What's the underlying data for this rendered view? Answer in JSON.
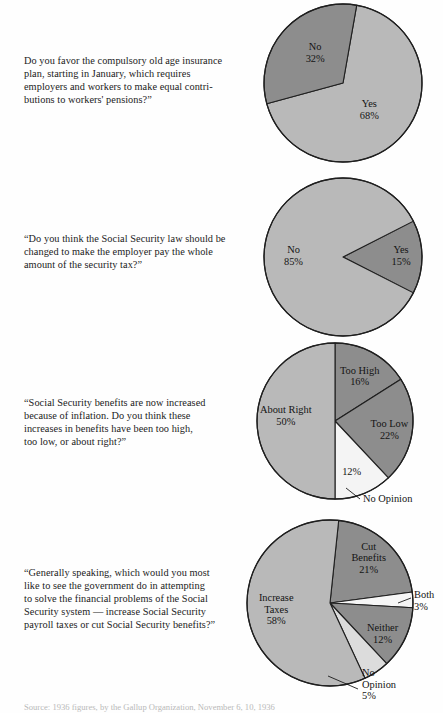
{
  "document": {
    "title": "Social Security Opinion Polls",
    "source_note": "Source: 1936 figures, by the Gallup Organization, November 6, 10, 1936"
  },
  "colors": {
    "page_background": "#fefefe",
    "slice_light": "#b9b9b9",
    "slice_dark": "#8d8d8d",
    "slice_pale": "#efefef",
    "slice_white": "#f7f7f7",
    "outline": "#1f1f1f",
    "text": "#1a1a1a"
  },
  "chart_data": [
    {
      "type": "pie",
      "id": "compulsory-old-age-insurance",
      "title": "Do you favor the compulsory old age insurance plan, starting in January, which requires employers and workers to make equal contributions to workers' pensions?”",
      "start_angle": 10,
      "categories": [
        "Yes",
        "No"
      ],
      "values": [
        68,
        32
      ],
      "labels": [
        "Yes\n68%",
        "No\n32%"
      ],
      "slice_colors": [
        "#b9b9b9",
        "#8d8d8d"
      ],
      "label_mode": [
        "inside",
        "inside"
      ],
      "label_radius": [
        0.52,
        0.58
      ],
      "legend": "none",
      "grid": false
    },
    {
      "type": "pie",
      "id": "employer-pay-whole-security-tax",
      "title": "“Do you think the Social Security law should be changed to make the employer pay the whole amount of the security tax?”",
      "start_angle": 63,
      "categories": [
        "Yes",
        "No"
      ],
      "values": [
        15,
        85
      ],
      "labels": [
        "Yes\n15%",
        "No\n85%"
      ],
      "slice_colors": [
        "#8d8d8d",
        "#b9b9b9"
      ],
      "label_mode": [
        "inside",
        "inside"
      ],
      "label_radius": [
        0.66,
        0.55
      ],
      "legend": "none",
      "grid": false
    },
    {
      "type": "pie",
      "id": "benefit-increases-too-high-low",
      "title": "“Social Security benefits are now increased because of inflation.  Do you think these increases in benefits have been too high, too low, or about right?”",
      "start_angle": 0,
      "categories": [
        "Too High",
        "Too Low",
        "No Opinion",
        "About Right"
      ],
      "values": [
        16,
        22,
        12,
        50
      ],
      "labels": [
        "Too High\n16%",
        "Too Low\n22%",
        "12%",
        "About Right\n50%"
      ],
      "slice_colors": [
        "#8d8d8d",
        "#8d8d8d",
        "#f4f4f4",
        "#b9b9b9"
      ],
      "label_mode": [
        "inside",
        "inside",
        "inside",
        "inside"
      ],
      "label_radius": [
        0.55,
        0.6,
        0.58,
        0.58
      ],
      "callouts": [
        {
          "text": "No Opinion",
          "slice": 2,
          "anchor": "start"
        }
      ],
      "legend": "none",
      "grid": false
    },
    {
      "type": "pie",
      "id": "increase-taxes-or-cut-benefits",
      "title": "“Generally speaking, which would you most like to see the government do in attempting to solve the financial problems of the Social Security system — increase Social Security payroll taxes or cut Social Security benefits?”",
      "start_angle": 6,
      "categories": [
        "Cut Benefits",
        "Both",
        "Neither",
        "No Opinion",
        "Increase Taxes"
      ],
      "values": [
        21,
        3,
        12,
        5,
        58
      ],
      "labels": [
        "Cut\nBenefits\n21%",
        "Both\n3%",
        "Neither\n12%",
        "No\nOpinion\n5%",
        "Increase\nTaxes\n58%"
      ],
      "slice_colors": [
        "#8d8d8d",
        "#f6f6f6",
        "#8d8d8d",
        "#dcdcdc",
        "#b9b9b9"
      ],
      "label_mode": [
        "inside",
        "outside",
        "inside",
        "outside",
        "inside"
      ],
      "label_radius": [
        0.6,
        0.6,
        0.62,
        0.6,
        0.56
      ],
      "callouts": [
        {
          "text": "Both\n3%",
          "slice": 1,
          "anchor": "start"
        },
        {
          "text": "No\nOpinion\n5%",
          "slice": 3,
          "anchor": "start"
        }
      ],
      "legend": "none",
      "grid": false
    }
  ],
  "panels": [
    {
      "question": "Do you favor the compulsory old age insurance plan, starting in January, which requires employers and workers to make equal contributions to workers' pensions?”",
      "question_lines": [
        "Do you favor the compulsory old age insurance",
        "plan, starting in January, which requires",
        "employers and workers to make equal contri-",
        "butions to workers' pensions?”"
      ]
    },
    {
      "question": "“Do you think the Social Security law should be changed to make the employer pay the whole amount of the security tax?”",
      "question_lines": [
        "“Do you think the Social Security law should be",
        "changed to make the employer pay the whole",
        "amount of the security tax?”"
      ]
    },
    {
      "question": "“Social Security benefits are now increased because of inflation.  Do you think these increases in benefits have been too high, too low, or about right?”",
      "question_lines": [
        "“Social Security benefits are now increased",
        "because of inflation.  Do you think these",
        "increases in benefits have been too high,",
        "too low, or about right?”"
      ]
    },
    {
      "question": "“Generally speaking, which would you most like to see the government do in attempting to solve the financial problems of the Social Security system — increase Social Security payroll taxes or cut Social Security benefits?”",
      "question_lines": [
        "“Generally speaking, which would you most",
        "like to see the government do in attempting",
        "to solve the financial problems of the Social",
        "Security system — increase Social Security",
        "payroll taxes or cut Social Security benefits?”"
      ]
    }
  ],
  "pie_labels": {
    "chart1": [
      {
        "name": "Yes",
        "pct": "68%"
      },
      {
        "name": "No",
        "pct": "32%"
      }
    ],
    "chart2": [
      {
        "name": "No",
        "pct": "85%"
      },
      {
        "name": "Yes",
        "pct": "15%"
      }
    ],
    "chart3": [
      {
        "name": "Too High",
        "pct": "16%"
      },
      {
        "name": "Too Low",
        "pct": "22%"
      },
      {
        "name": "",
        "pct": "12%"
      },
      {
        "name": "About Right",
        "pct": "50%"
      },
      {
        "name": "No Opinion",
        "pct": ""
      }
    ],
    "chart4": [
      {
        "name": "Cut Benefits",
        "pct": "21%"
      },
      {
        "name": "Both",
        "pct": "3%"
      },
      {
        "name": "Neither",
        "pct": "12%"
      },
      {
        "name": "No Opinion",
        "pct": "5%"
      },
      {
        "name": "Increase Taxes",
        "pct": "58%"
      }
    ]
  }
}
